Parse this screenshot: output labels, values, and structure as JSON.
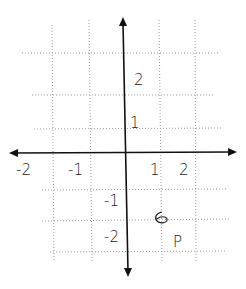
{
  "diagram": {
    "type": "hand-drawn coordinate plane",
    "axes": {
      "x_ticks": [
        {
          "value": -2,
          "label": "-2"
        },
        {
          "value": -1,
          "label": "-1"
        },
        {
          "value": 1,
          "label": "1"
        },
        {
          "value": 2,
          "label": "2"
        }
      ],
      "y_ticks": [
        {
          "value": 2,
          "label": "2"
        },
        {
          "value": 1,
          "label": "1"
        },
        {
          "value": -1,
          "label": "-1"
        },
        {
          "value": -2,
          "label": "-2"
        }
      ]
    },
    "labels": {
      "y_pos2": "2",
      "y_pos1": "1",
      "x_neg2": "-2",
      "x_neg1": "-1",
      "x_pos1": "1",
      "x_pos2": "2",
      "y_neg1": "-1",
      "y_neg2": "-2",
      "point_P": "P"
    },
    "points": [
      {
        "name": "P",
        "x": 1,
        "y": -1.5,
        "marker": "6"
      }
    ],
    "grid": "dotted"
  }
}
